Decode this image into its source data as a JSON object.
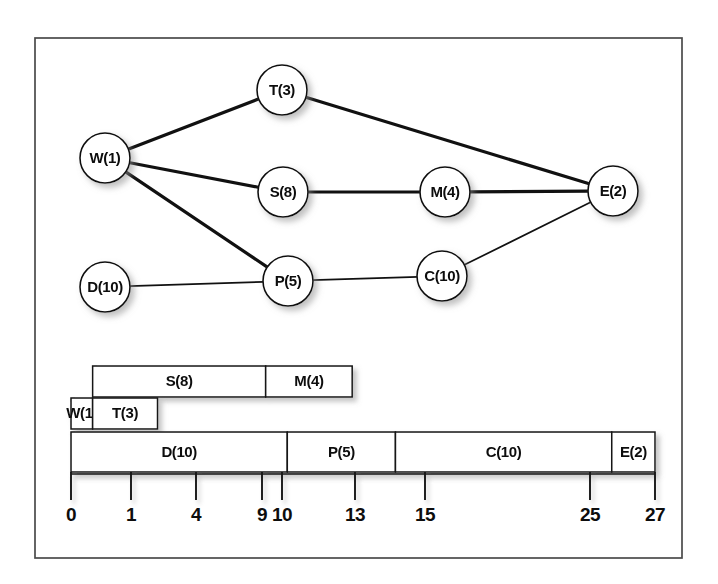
{
  "figure": {
    "frame": {
      "x": 35,
      "y": 38,
      "width": 647,
      "height": 520,
      "color": "#4a4a4a"
    },
    "background_color": "#ffffff",
    "line_color": "#111111",
    "fill_color": "#ffffff"
  },
  "network": {
    "name": "activity-network",
    "node_radius": 25,
    "nodes": [
      {
        "id": "W",
        "label": "W(1)",
        "duration": 1,
        "cx": 105,
        "cy": 158
      },
      {
        "id": "T",
        "label": "T(3)",
        "duration": 3,
        "cx": 282,
        "cy": 90
      },
      {
        "id": "S",
        "label": "S(8)",
        "duration": 8,
        "cx": 283,
        "cy": 192
      },
      {
        "id": "D",
        "label": "D(10)",
        "duration": 10,
        "cx": 105,
        "cy": 287
      },
      {
        "id": "P",
        "label": "P(5)",
        "duration": 5,
        "cx": 288,
        "cy": 281
      },
      {
        "id": "M",
        "label": "M(4)",
        "duration": 4,
        "cx": 445,
        "cy": 192
      },
      {
        "id": "C",
        "label": "C(10)",
        "duration": 10,
        "cx": 442,
        "cy": 276
      },
      {
        "id": "E",
        "label": "E(2)",
        "duration": 2,
        "cx": 613,
        "cy": 191
      }
    ],
    "edges": [
      {
        "from": "W",
        "to": "T",
        "weight": "thick"
      },
      {
        "from": "W",
        "to": "S",
        "weight": "thick"
      },
      {
        "from": "W",
        "to": "P",
        "weight": "thick"
      },
      {
        "from": "T",
        "to": "E",
        "weight": "thick"
      },
      {
        "from": "S",
        "to": "M",
        "weight": "thick"
      },
      {
        "from": "M",
        "to": "E",
        "weight": "thick"
      },
      {
        "from": "D",
        "to": "P",
        "weight": "thin"
      },
      {
        "from": "P",
        "to": "C",
        "weight": "thin"
      },
      {
        "from": "C",
        "to": "E",
        "weight": "thin"
      }
    ]
  },
  "gantt": {
    "name": "gantt-schedule",
    "scale": {
      "x0": 71,
      "x27": 655,
      "px_per_unit": 21.63
    },
    "rows": [
      {
        "index": 0,
        "y": 366,
        "height": 31,
        "bars": [
          {
            "label": "S(8)",
            "start": 1,
            "end": 9
          },
          {
            "label": "M(4)",
            "start": 9,
            "end": 13
          }
        ]
      },
      {
        "index": 1,
        "y": 398,
        "height": 31,
        "bars": [
          {
            "label": "W(1)",
            "start": 0,
            "end": 1
          },
          {
            "label": "T(3)",
            "start": 1,
            "end": 4
          }
        ]
      },
      {
        "index": 2,
        "y": 432,
        "height": 40,
        "bars": [
          {
            "label": "D(10)",
            "start": 0,
            "end": 10
          },
          {
            "label": "P(5)",
            "start": 10,
            "end": 15
          },
          {
            "label": "C(10)",
            "start": 15,
            "end": 25
          },
          {
            "label": "E(2)",
            "start": 25,
            "end": 27
          }
        ]
      }
    ],
    "axis": {
      "y": 474,
      "tick_bottom": 500,
      "label_y": 521,
      "ticks": [
        {
          "value": 0,
          "label": "0",
          "x": 71
        },
        {
          "value": 1,
          "label": "1",
          "x": 131
        },
        {
          "value": 4,
          "label": "4",
          "x": 196
        },
        {
          "value": 9,
          "label": "9",
          "x": 262
        },
        {
          "value": 10,
          "label": "10",
          "x": 282
        },
        {
          "value": 13,
          "label": "13",
          "x": 355
        },
        {
          "value": 15,
          "label": "15",
          "x": 425
        },
        {
          "value": 25,
          "label": "25",
          "x": 590
        },
        {
          "value": 27,
          "label": "27",
          "x": 655
        }
      ]
    }
  }
}
